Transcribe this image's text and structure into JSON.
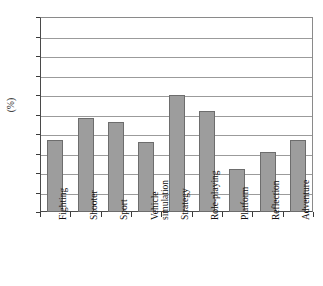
{
  "chart_data": {
    "type": "bar",
    "title": "",
    "xlabel": "",
    "ylabel": "(%)",
    "ylim": [
      0,
      100
    ],
    "ytick_step": 10,
    "grid": true,
    "legend": "none",
    "bar_color": "#9d9d9d",
    "bar_edge_color": "#6d6d6d",
    "categories": [
      "Fighting",
      "Shooter",
      "Sport",
      "Vehicle\nsimulation",
      "Strategy",
      "Role-playing",
      "Platform",
      "Reflection",
      "Adventure"
    ],
    "values": [
      37,
      48,
      46,
      36,
      60,
      52,
      22,
      31,
      37
    ],
    "ytick_labels": [
      "0",
      "10",
      "20",
      "30",
      "40",
      "50",
      "60",
      "70",
      "80",
      "90",
      "100"
    ]
  }
}
